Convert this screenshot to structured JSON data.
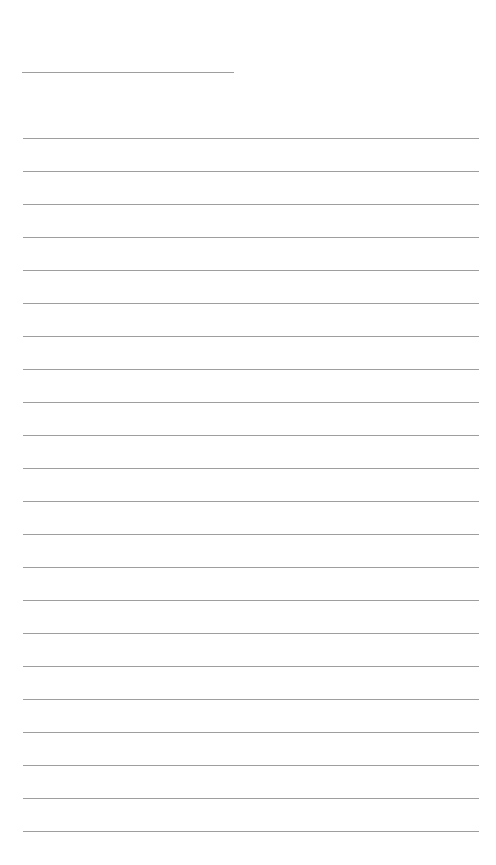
{
  "page": {
    "type": "lined-paper",
    "background": "#ffffff",
    "line_color": "#9e9e9e"
  },
  "title_line": {
    "x": 22,
    "y": 72,
    "width": 212
  },
  "writing_lines": {
    "count": 22,
    "x": 23,
    "first_y": 138,
    "spacing": 33,
    "width": 456
  }
}
